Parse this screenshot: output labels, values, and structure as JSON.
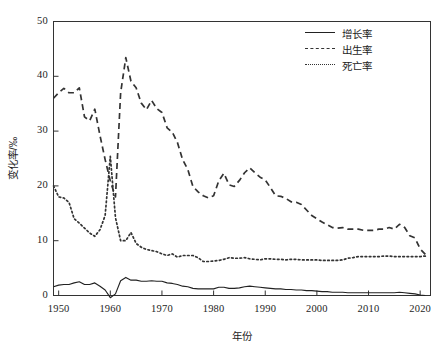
{
  "chart_data": {
    "type": "line",
    "title": "",
    "xlabel": "年份",
    "ylabel": "变化率/‰",
    "xlim": [
      1949,
      2022
    ],
    "ylim": [
      0,
      50
    ],
    "xticks": [
      1950,
      1960,
      1970,
      1980,
      1990,
      2000,
      2010,
      2020
    ],
    "xtick_labels": [
      "1950",
      "1960",
      "1970",
      "1980",
      "1990",
      "2000",
      "2010",
      "2020"
    ],
    "yticks": [
      0,
      10,
      20,
      30,
      40,
      50
    ],
    "ytick_labels": [
      "0",
      "10",
      "20",
      "30",
      "40",
      "50"
    ],
    "grid": false,
    "legend_position": "top-right",
    "x": [
      1949,
      1950,
      1951,
      1952,
      1953,
      1954,
      1955,
      1956,
      1957,
      1958,
      1959,
      1960,
      1961,
      1962,
      1963,
      1964,
      1965,
      1966,
      1967,
      1968,
      1969,
      1970,
      1971,
      1972,
      1973,
      1974,
      1975,
      1976,
      1977,
      1978,
      1979,
      1980,
      1981,
      1982,
      1983,
      1984,
      1985,
      1986,
      1987,
      1988,
      1989,
      1990,
      1991,
      1992,
      1993,
      1994,
      1995,
      1996,
      1997,
      1998,
      1999,
      2000,
      2001,
      2002,
      2003,
      2004,
      2005,
      2006,
      2007,
      2008,
      2009,
      2010,
      2011,
      2012,
      2013,
      2014,
      2015,
      2016,
      2017,
      2018,
      2019,
      2020,
      2021
    ],
    "series": [
      {
        "name": "增长率",
        "style": "solid",
        "color": "#222222",
        "values": [
          1.6,
          1.9,
          2.0,
          2.0,
          2.3,
          2.5,
          2.0,
          2.0,
          2.3,
          1.7,
          1.0,
          -0.4,
          0.3,
          2.7,
          3.3,
          2.8,
          2.8,
          2.6,
          2.6,
          2.7,
          2.6,
          2.6,
          2.3,
          2.2,
          2.0,
          1.7,
          1.6,
          1.3,
          1.2,
          1.2,
          1.2,
          1.2,
          1.5,
          1.5,
          1.3,
          1.3,
          1.4,
          1.6,
          1.7,
          1.6,
          1.5,
          1.4,
          1.3,
          1.2,
          1.2,
          1.1,
          1.1,
          1.0,
          1.0,
          0.9,
          0.9,
          0.8,
          0.7,
          0.7,
          0.6,
          0.6,
          0.6,
          0.5,
          0.5,
          0.5,
          0.5,
          0.5,
          0.5,
          0.5,
          0.5,
          0.5,
          0.5,
          0.6,
          0.5,
          0.4,
          0.3,
          0.1,
          0.0
        ],
        "marker": "none"
      },
      {
        "name": "出生率",
        "style": "dashed",
        "color": "#333333",
        "values": [
          36.0,
          37.0,
          37.8,
          37.0,
          37.0,
          37.9,
          32.6,
          31.9,
          34.0,
          29.2,
          24.8,
          20.9,
          18.0,
          37.0,
          43.4,
          39.1,
          37.9,
          35.1,
          33.9,
          35.6,
          34.1,
          33.4,
          30.6,
          29.8,
          27.9,
          24.8,
          23.0,
          19.9,
          18.9,
          18.2,
          17.8,
          18.2,
          20.9,
          22.3,
          20.2,
          19.9,
          21.0,
          22.4,
          23.3,
          22.4,
          21.6,
          21.1,
          19.7,
          18.2,
          18.1,
          17.7,
          17.1,
          17.0,
          16.6,
          15.6,
          14.6,
          14.0,
          13.4,
          12.9,
          12.4,
          12.3,
          12.4,
          12.1,
          12.1,
          12.1,
          11.9,
          11.9,
          11.9,
          12.1,
          12.1,
          12.4,
          12.1,
          13.0,
          12.4,
          10.9,
          10.5,
          8.5,
          7.5
        ],
        "marker": "none"
      },
      {
        "name": "死亡率",
        "style": "dotted",
        "color": "#333333",
        "values": [
          20.0,
          18.0,
          17.8,
          17.0,
          14.0,
          13.2,
          12.3,
          11.4,
          10.8,
          12.0,
          14.6,
          25.4,
          14.2,
          10.0,
          10.0,
          11.5,
          9.5,
          8.8,
          8.4,
          8.2,
          8.0,
          7.6,
          7.3,
          7.6,
          7.0,
          7.3,
          7.3,
          7.3,
          6.9,
          6.2,
          6.2,
          6.3,
          6.4,
          6.6,
          6.9,
          6.8,
          6.8,
          6.9,
          6.7,
          6.6,
          6.5,
          6.7,
          6.7,
          6.6,
          6.6,
          6.5,
          6.6,
          6.6,
          6.5,
          6.5,
          6.5,
          6.5,
          6.4,
          6.4,
          6.4,
          6.4,
          6.5,
          6.8,
          6.9,
          7.1,
          7.1,
          7.1,
          7.1,
          7.1,
          7.2,
          7.2,
          7.1,
          7.1,
          7.1,
          7.1,
          7.1,
          7.1,
          7.2
        ],
        "marker": "none"
      }
    ]
  },
  "legend": {
    "items": [
      {
        "label": "增长率",
        "style": "solid"
      },
      {
        "label": "出生率",
        "style": "dashed"
      },
      {
        "label": "死亡率",
        "style": "dotted"
      }
    ]
  },
  "axes": {
    "x_title": "年份",
    "y_title": "变化率/‰"
  }
}
